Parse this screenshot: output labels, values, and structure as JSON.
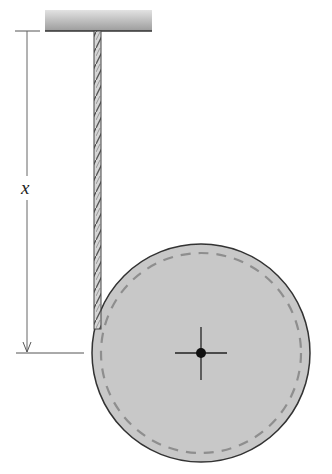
{
  "diagram": {
    "type": "physics-figure",
    "labels": {
      "distance": "x"
    },
    "elements": {
      "ceiling": {
        "x": 45,
        "y": 10,
        "width": 107,
        "height": 21
      },
      "cord": {
        "x": 97.5,
        "y_top": 31,
        "y_bottom": 330
      },
      "disk": {
        "cx": 201,
        "cy": 353,
        "r": 109,
        "fill": "#c8c8c8",
        "stroke": "#333333"
      },
      "dashed_circle": {
        "r": 100,
        "stroke": "#8a8a8a"
      },
      "center": {
        "cx": 201,
        "cy": 353,
        "crosshair_half": 26,
        "dot_r": 5
      },
      "dimension": {
        "x": 27,
        "y_top": 31,
        "y_bottom": 353,
        "label_y": 188
      }
    },
    "colors": {
      "disk_fill": "#c6c6c6",
      "ceiling_top": "#e0e0e0",
      "ceiling_bottom": "#9a9a9a",
      "line": "#444444"
    }
  }
}
